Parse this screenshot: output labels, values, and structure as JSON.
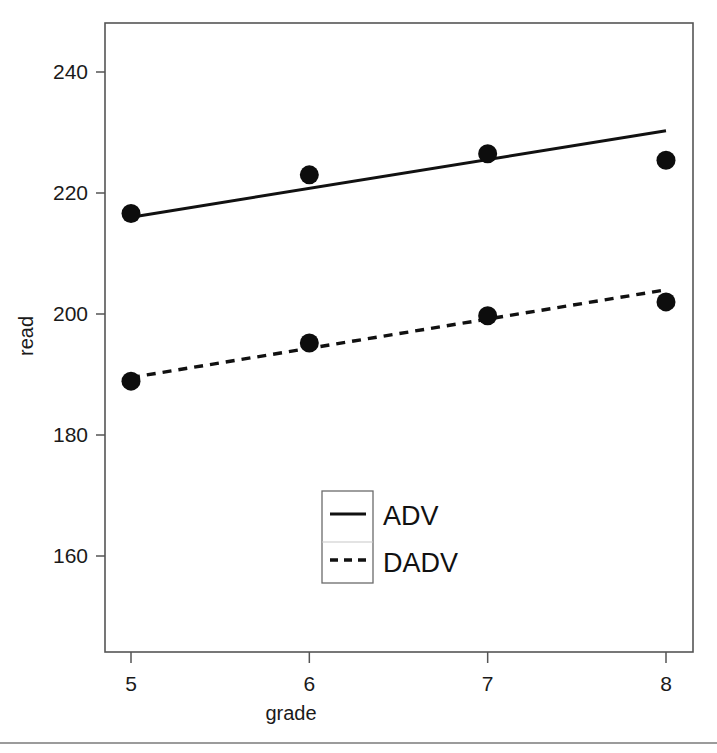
{
  "chart_data": {
    "type": "line",
    "title": "",
    "subtitle": "",
    "xlabel": "grade",
    "ylabel": "read",
    "x": [
      5,
      6,
      7,
      8
    ],
    "xtick_labels": [
      "5",
      "6",
      "7",
      "8"
    ],
    "ytick_labels": [
      "160",
      "180",
      "200",
      "220",
      "240"
    ],
    "ytick_values": [
      160,
      180,
      200,
      220,
      240
    ],
    "xlim": [
      4.85,
      8.15
    ],
    "ylim": [
      146,
      248
    ],
    "grid": false,
    "legend_position": "bottom-center",
    "series": [
      {
        "name": "ADV",
        "style": "solid",
        "marker": "filled-circle",
        "values": [
          216.6,
          223.0,
          226.5,
          225.4
        ],
        "fit_line": {
          "x_start": 5,
          "y_start": 216.0,
          "x_end": 8,
          "y_end": 230.3
        }
      },
      {
        "name": "DADV",
        "style": "dashed",
        "marker": "filled-circle",
        "values": [
          188.9,
          195.2,
          199.7,
          202.0
        ],
        "fit_line": {
          "x_start": 5,
          "y_start": 189.5,
          "x_end": 8,
          "y_end": 204.0
        }
      }
    ],
    "legend_entries": [
      {
        "label": "ADV",
        "style": "solid"
      },
      {
        "label": "DADV",
        "style": "dashed"
      }
    ],
    "colors": {
      "series": "#111111",
      "axis": "#555555",
      "background": "#ffffff",
      "legend_border": "#6b6b6b"
    }
  }
}
